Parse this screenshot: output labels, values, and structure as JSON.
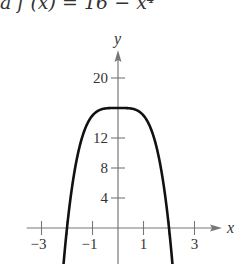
{
  "title_fragment": "a f (x) = 16 − x⁴",
  "chart_data": {
    "type": "line",
    "function": "16 - x^4",
    "xlabel": "x",
    "ylabel": "y",
    "xlim": [
      -3.5,
      4.3
    ],
    "ylim": [
      -4.8,
      23
    ],
    "x_ticks": [
      -3,
      -2,
      -1,
      1,
      2,
      3
    ],
    "x_tick_labels": [
      "-3",
      "-1",
      "1",
      "3"
    ],
    "y_ticks": [
      4,
      8,
      12,
      16,
      20
    ],
    "y_tick_labels": [
      "4",
      "8",
      "12",
      "20"
    ],
    "grid": false,
    "legend": null,
    "series": [
      {
        "name": "f(x) = 16 − x⁴",
        "x": [
          -2.14,
          -2,
          -1.75,
          -1.5,
          -1.25,
          -1,
          -0.75,
          -0.5,
          -0.25,
          0,
          0.25,
          0.5,
          0.75,
          1,
          1.25,
          1.5,
          1.75,
          2,
          2.14
        ],
        "y": [
          -4.97,
          0,
          6.62,
          10.94,
          13.56,
          15,
          15.68,
          15.94,
          16.0,
          16,
          16.0,
          15.94,
          15.68,
          15,
          13.56,
          10.94,
          6.62,
          0,
          -4.97
        ]
      }
    ],
    "colors": {
      "curve": "#111111",
      "axes": "#777777",
      "text": "#333333"
    }
  }
}
